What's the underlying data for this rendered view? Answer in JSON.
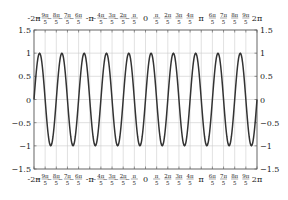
{
  "chart_data": {
    "type": "line",
    "title": "",
    "xlabel": "",
    "ylabel": "",
    "function": "sin(5x)",
    "xlim": [
      -6.283185307,
      6.283185307
    ],
    "ylim": [
      -1.5,
      1.5
    ],
    "grid": true,
    "series": [
      {
        "name": "sin(5x)",
        "color": "#333333",
        "samples": 400
      }
    ],
    "x_ticks": [
      {
        "value": -6.283185,
        "label": "-2π",
        "type": "simple"
      },
      {
        "value": -5.654867,
        "num": "9π",
        "den": "5",
        "type": "frac"
      },
      {
        "value": -5.026548,
        "num": "8π",
        "den": "5",
        "type": "frac"
      },
      {
        "value": -4.39823,
        "num": "7π",
        "den": "5",
        "type": "frac"
      },
      {
        "value": -3.769911,
        "num": "6π",
        "den": "5",
        "type": "frac"
      },
      {
        "value": -3.141593,
        "label": "-π",
        "type": "simple"
      },
      {
        "value": -2.513274,
        "num": "4π",
        "den": "5",
        "type": "frac"
      },
      {
        "value": -1.884956,
        "num": "3π",
        "den": "5",
        "type": "frac"
      },
      {
        "value": -1.256637,
        "num": "2π",
        "den": "5",
        "type": "frac"
      },
      {
        "value": -0.628319,
        "num": "π",
        "den": "5",
        "type": "frac"
      },
      {
        "value": 0,
        "label": "0",
        "type": "simple"
      },
      {
        "value": 0.628319,
        "num": "π",
        "den": "5",
        "type": "frac"
      },
      {
        "value": 1.256637,
        "num": "2π",
        "den": "5",
        "type": "frac"
      },
      {
        "value": 1.884956,
        "num": "3π",
        "den": "5",
        "type": "frac"
      },
      {
        "value": 2.513274,
        "num": "4π",
        "den": "5",
        "type": "frac"
      },
      {
        "value": 3.141593,
        "label": "π",
        "type": "simple"
      },
      {
        "value": 3.769911,
        "num": "6π",
        "den": "5",
        "type": "frac"
      },
      {
        "value": 4.39823,
        "num": "7π",
        "den": "5",
        "type": "frac"
      },
      {
        "value": 5.026548,
        "num": "8π",
        "den": "5",
        "type": "frac"
      },
      {
        "value": 5.654867,
        "num": "9π",
        "den": "5",
        "type": "frac"
      },
      {
        "value": 6.283185,
        "label": "2π",
        "type": "simple"
      }
    ],
    "y_ticks": [
      {
        "value": 1.5,
        "label": "1.5"
      },
      {
        "value": 1,
        "label": "1"
      },
      {
        "value": 0.5,
        "label": "0.5"
      },
      {
        "value": 0,
        "label": "0"
      },
      {
        "value": -0.5,
        "label": "−0.5"
      },
      {
        "value": -1,
        "label": "−1"
      },
      {
        "value": -1.5,
        "label": "−1.5"
      }
    ],
    "axes_labels_on": [
      "top",
      "bottom",
      "left",
      "right"
    ],
    "grid_color": "#cccccc",
    "frame_color": "#555555"
  }
}
